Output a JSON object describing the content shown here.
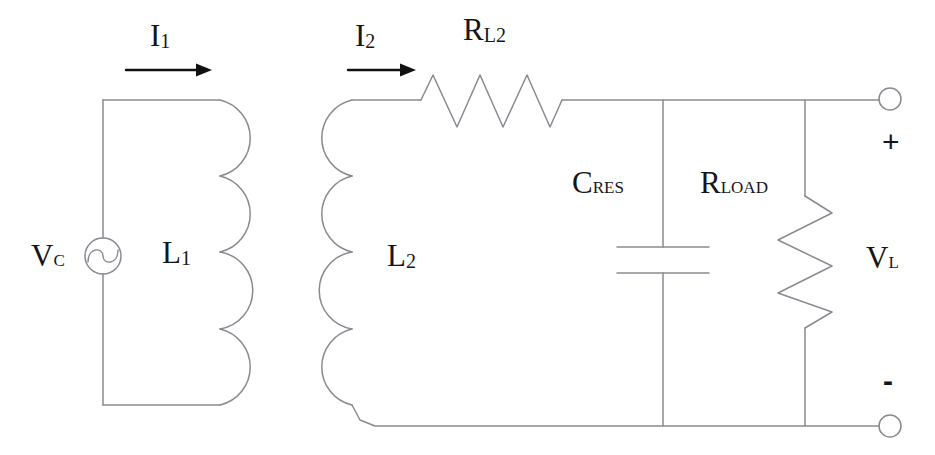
{
  "diagram": {
    "type": "electrical-schematic",
    "stroke_color": "#8a8a92",
    "text_color": "#16161a",
    "background": "#ffffff"
  },
  "labels": {
    "current_1": {
      "base": "I",
      "sub": "1"
    },
    "current_2": {
      "base": "I",
      "sub": "2"
    },
    "resistor_l2": {
      "base": "R",
      "sub": "L2"
    },
    "source_voltage": {
      "base": "V",
      "sub": "C"
    },
    "inductor_1": {
      "base": "L",
      "sub": "1"
    },
    "inductor_2": {
      "base": "L",
      "sub": "2"
    },
    "capacitor_res": {
      "base": "C",
      "sub": "RES"
    },
    "resistor_load": {
      "base": "R",
      "sub": "LOAD"
    },
    "output_voltage": {
      "base": "V",
      "sub": "L"
    },
    "terminal_positive": "+",
    "terminal_negative": "-"
  },
  "components": {
    "voltage_source": {
      "name": "AC voltage source",
      "symbol": "circle-with-sine"
    },
    "primary_coil": {
      "name": "Primary inductor",
      "turns": 4
    },
    "secondary_coil": {
      "name": "Secondary inductor",
      "turns": 4
    },
    "series_resistor": {
      "name": "Coil resistance",
      "zigzag_peaks": 3
    },
    "resonant_capacitor": {
      "name": "Resonant capacitor",
      "plates": 2
    },
    "load_resistor": {
      "name": "Load resistor",
      "zigzag_peaks": 3
    },
    "output_terminals": {
      "count": 2,
      "symbol": "open-circle"
    }
  }
}
